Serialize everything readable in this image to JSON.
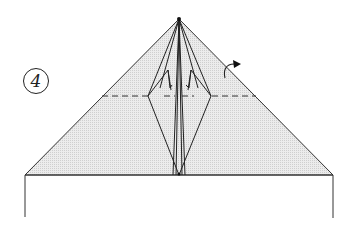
{
  "diagram": {
    "step_number": "4",
    "colors": {
      "paper_fill": "#e4e4e4",
      "line": "#333333",
      "background": "#ffffff"
    },
    "elements": [
      "step-number-circle",
      "triangle-paper-shape",
      "horizontal-valley-fold-dashed-line",
      "center-kite-flaps",
      "fold-arrow",
      "rectangular-base-outline"
    ]
  }
}
